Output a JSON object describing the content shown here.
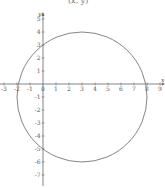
{
  "caption_fragment": "(x, y)",
  "chart_data": {
    "type": "line",
    "title": "",
    "xlabel": "x",
    "ylabel": "y",
    "xlim": [
      -3,
      9
    ],
    "ylim": [
      -7,
      5
    ],
    "grid": false,
    "legend": null,
    "x_ticks": [
      -3,
      -2,
      -1,
      0,
      1,
      2,
      3,
      4,
      5,
      6,
      7,
      8,
      9
    ],
    "y_ticks": [
      -7,
      -6,
      -5,
      -4,
      -3,
      -2,
      -1,
      1,
      2,
      3,
      4,
      5
    ],
    "series": [
      {
        "name": "circle",
        "shape": "circle",
        "center": [
          3,
          -1
        ],
        "radius": 5,
        "equation": "(x-3)^2 + (y+1)^2 = 25",
        "key_points": [
          [
            3,
            4
          ],
          [
            3,
            -6
          ],
          [
            -2,
            -1
          ],
          [
            8,
            -1
          ],
          [
            0,
            3
          ],
          [
            0,
            -5
          ],
          [
            -1.9,
            0
          ],
          [
            7.9,
            0
          ]
        ]
      }
    ],
    "colors": {
      "curve": "#777777",
      "axis": "#666666"
    }
  }
}
